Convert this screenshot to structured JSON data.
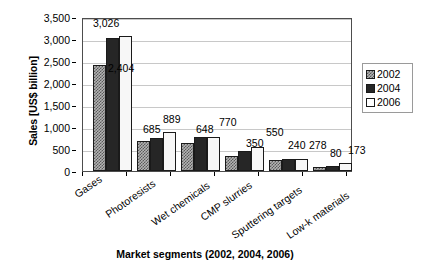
{
  "chart_data": {
    "type": "bar",
    "title": "",
    "xlabel": "Market segments (2002, 2004, 2006)",
    "ylabel": "Sales [US$ billion]",
    "ylim": [
      0,
      3500
    ],
    "ytick_labels": [
      "0",
      "500",
      "1,000",
      "1,500",
      "2,000",
      "2,500",
      "3,000",
      "3,500"
    ],
    "ytick_values": [
      0,
      500,
      1000,
      1500,
      2000,
      2500,
      3000,
      3500
    ],
    "grid": "horizontal",
    "legend_position": "right",
    "categories": [
      "Gases",
      "Photoresists",
      "Wet chemicals",
      "CMP slurries",
      "Sputtering targets",
      "Low-k materials"
    ],
    "series": [
      {
        "name": "2002",
        "color": "#b3b3b3",
        "pattern": "checkered",
        "values": [
          2404,
          685,
          648,
          350,
          240,
          80
        ]
      },
      {
        "name": "2004",
        "color": "#262626",
        "pattern": "solid",
        "values": [
          3026,
          755,
          762,
          452,
          268,
          120
        ]
      },
      {
        "name": "2006",
        "color": "#ffffff",
        "pattern": "empty",
        "values": [
          3060,
          889,
          770,
          550,
          278,
          173
        ]
      }
    ],
    "data_labels": [
      {
        "text": "3,026",
        "x": 93,
        "y": 18
      },
      {
        "text": "2,404",
        "x": 108,
        "y": 63
      },
      {
        "text": "685",
        "x": 143,
        "y": 124
      },
      {
        "text": "889",
        "x": 163,
        "y": 115
      },
      {
        "text": "648",
        "x": 196,
        "y": 124
      },
      {
        "text": "770",
        "x": 219,
        "y": 117
      },
      {
        "text": "350",
        "x": 246,
        "y": 138
      },
      {
        "text": "550",
        "x": 266,
        "y": 127
      },
      {
        "text": "240",
        "x": 288,
        "y": 140
      },
      {
        "text": "278",
        "x": 309,
        "y": 140
      },
      {
        "text": "80",
        "x": 329,
        "y": 149
      },
      {
        "text": "173",
        "x": 348,
        "y": 146
      }
    ]
  },
  "legend": {
    "items": [
      {
        "label": "2002",
        "swatch": "swatch-2002"
      },
      {
        "label": "2004",
        "swatch": "swatch-2004"
      },
      {
        "label": "2006",
        "swatch": "swatch-2006"
      }
    ]
  },
  "axis": {
    "y_title": "Sales [US$ billion]",
    "x_title": "Market segments (2002, 2004, 2006)"
  }
}
